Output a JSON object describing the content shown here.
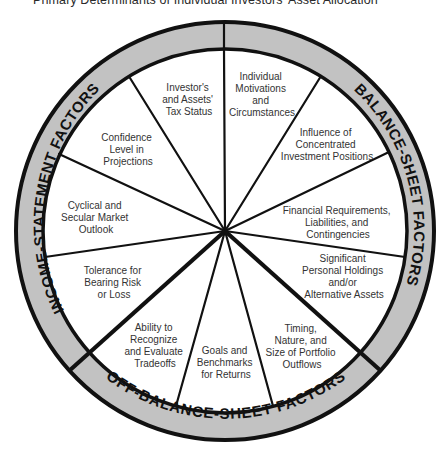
{
  "title": "Primary Determinants of Individual Investors' Asset Allocation",
  "colors": {
    "ring_fill": "#c2c2c2",
    "stroke": "#111111",
    "background": "#ffffff",
    "text": "#333333"
  },
  "ring": {
    "income_statement": "INCOME-STATEMENT FACTORS",
    "balance_sheet": "BALANCE-SHEET FACTORS",
    "off_balance_sheet": "OFF-BALANCE-SHEET FACTORS"
  },
  "segments": {
    "tax_status": [
      "Investor's",
      "and Assets'",
      "Tax Status"
    ],
    "confidence": [
      "Confidence",
      "Level in",
      "Projections"
    ],
    "cyclical": [
      "Cyclical and",
      "Secular Market",
      "Outlook"
    ],
    "tolerance": [
      "Tolerance for",
      "Bearing Risk",
      "or Loss"
    ],
    "tradeoffs": [
      "Ability to",
      "Recognize",
      "and Evaluate",
      "Tradeoffs"
    ],
    "goals": [
      "Goals and",
      "Benchmarks",
      "for Returns"
    ],
    "timing": [
      "Timing,",
      "Nature, and",
      "Size of Portfolio",
      "Outflows"
    ],
    "holdings": [
      "Significant",
      "Personal Holdings",
      "and/or",
      "Alternative Assets"
    ],
    "financial": [
      "Financial Requirements,",
      "Liabilities, and",
      "Contingencies"
    ],
    "concentrated": [
      "Influence of",
      "Concentrated",
      "Investment Positions"
    ],
    "motivations": [
      "Individual",
      "Motivations",
      "and",
      "Circumstances"
    ]
  }
}
